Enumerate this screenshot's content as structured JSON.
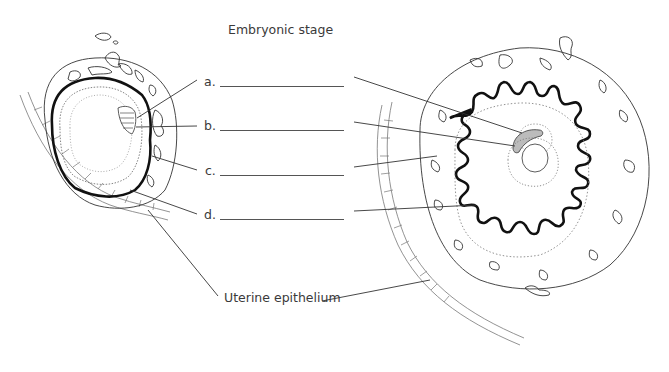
{
  "title": "Embryonic stage",
  "labels": [
    {
      "id": "a",
      "text": "a."
    },
    {
      "id": "b",
      "text": "b."
    },
    {
      "id": "c",
      "text": "c."
    },
    {
      "id": "d",
      "text": "d."
    }
  ],
  "uterine_label": "Uterine epithelium",
  "colors": {
    "line": "#444444",
    "thick": "#111111",
    "text": "#3a3a3a"
  }
}
